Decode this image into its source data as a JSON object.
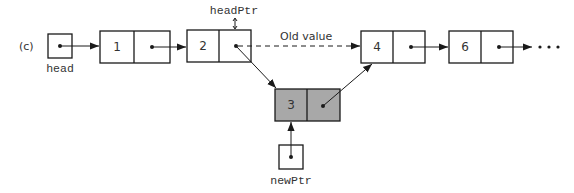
{
  "figure": {
    "part_label": "(c)",
    "ellipsis": "•••"
  },
  "pointers": {
    "head": {
      "label": "head"
    },
    "headPtr": {
      "label": "headPtr",
      "marker": "↕"
    },
    "newPtr": {
      "label": "newPtr"
    }
  },
  "nodes": [
    {
      "value": "1",
      "shaded": false
    },
    {
      "value": "2",
      "shaded": false
    },
    {
      "value": "3",
      "shaded": true
    },
    {
      "value": "4",
      "shaded": false
    },
    {
      "value": "6",
      "shaded": false
    }
  ],
  "annotations": {
    "old_link_label": "Old value"
  },
  "colors": {
    "line": "#1a1a1a",
    "new_node_fill": "#a8a8a8",
    "text": "#333333"
  }
}
